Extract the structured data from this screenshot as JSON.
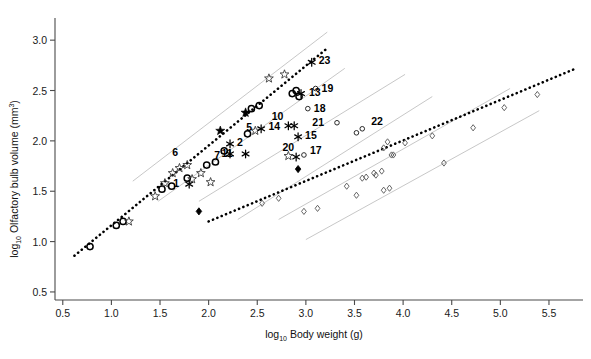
{
  "figure": {
    "background": "#ffffff",
    "axis_color": "#4a4a4a",
    "band_color": "#b9b9b9",
    "marker_color": "#000000"
  },
  "chart_data": {
    "type": "scatter",
    "title": "",
    "subtitle": "",
    "xlabel": "log10 Body weight (g)",
    "ylabel": "log10 Olfactory bulb volume (mm3)",
    "xlabel_main": "Body weight (g)",
    "xlabel_base": "log",
    "xlabel_sub": "10",
    "ylabel_main": "Olfactory bulb volume (mm",
    "ylabel_main_tail": ")",
    "ylabel_sup": "3",
    "ylabel_base": "log",
    "ylabel_sub": "10",
    "xlim": [
      0.42,
      5.85
    ],
    "ylim": [
      0.42,
      3.22
    ],
    "xticks": [
      0.5,
      1.0,
      1.5,
      2.0,
      2.5,
      3.0,
      3.5,
      4.0,
      4.5,
      5.0,
      5.5
    ],
    "yticks": [
      0.5,
      1.0,
      1.5,
      2.0,
      2.5,
      3.0
    ],
    "xticklabels": [
      "0.5",
      "1.0",
      "1.5",
      "2.0",
      "2.5",
      "3.0",
      "3.5",
      "4.0",
      "4.5",
      "5.0",
      "5.5"
    ],
    "yticklabels": [
      "0.5",
      "1.0",
      "1.5",
      "2.0",
      "2.5",
      "3.0"
    ],
    "grid": false,
    "legend": "none",
    "series": [
      {
        "name": "open-circle",
        "marker": "open-circle",
        "points": [
          [
            0.78,
            0.95
          ],
          [
            1.05,
            1.16
          ],
          [
            1.12,
            1.2
          ],
          [
            1.52,
            1.52
          ],
          [
            1.62,
            1.55
          ],
          [
            1.78,
            1.63
          ],
          [
            1.98,
            1.76
          ],
          [
            2.07,
            1.79
          ],
          [
            2.16,
            1.9
          ],
          [
            2.4,
            2.07
          ],
          [
            2.44,
            2.32
          ],
          [
            2.52,
            2.35
          ],
          [
            2.86,
            2.47
          ],
          [
            2.9,
            2.5
          ],
          [
            2.93,
            2.44
          ]
        ]
      },
      {
        "name": "open-star",
        "marker": "open-star",
        "points": [
          [
            1.18,
            1.2
          ],
          [
            1.45,
            1.45
          ],
          [
            1.55,
            1.58
          ],
          [
            1.63,
            1.68
          ],
          [
            1.7,
            1.73
          ],
          [
            1.78,
            1.76
          ],
          [
            1.83,
            1.62
          ],
          [
            1.92,
            1.68
          ],
          [
            2.02,
            1.59
          ],
          [
            2.48,
            2.1
          ],
          [
            2.62,
            2.62
          ],
          [
            2.78,
            2.66
          ],
          [
            2.82,
            1.85
          ]
        ]
      },
      {
        "name": "filled-star",
        "marker": "filled-star",
        "points": [
          [
            2.12,
            2.1
          ],
          [
            2.38,
            2.28
          ]
        ]
      },
      {
        "name": "asterisk-labeled",
        "marker": "asterisk",
        "points": [
          [
            1.8,
            1.57
          ],
          [
            2.22,
            1.97
          ],
          [
            2.22,
            1.87
          ],
          [
            2.38,
            1.87
          ],
          [
            2.54,
            2.12
          ],
          [
            2.82,
            2.15
          ],
          [
            2.88,
            2.15
          ],
          [
            2.95,
            2.47
          ],
          [
            2.92,
            2.04
          ],
          [
            2.9,
            1.84
          ],
          [
            3.06,
            2.78
          ]
        ]
      },
      {
        "name": "filled-diamond",
        "marker": "filled-diamond",
        "points": [
          [
            1.9,
            1.3
          ],
          [
            2.92,
            1.72
          ]
        ]
      },
      {
        "name": "open-diamond",
        "marker": "open-diamond",
        "points": [
          [
            2.55,
            1.38
          ],
          [
            2.72,
            1.43
          ],
          [
            2.98,
            1.3
          ],
          [
            3.12,
            1.33
          ],
          [
            3.42,
            1.55
          ],
          [
            3.58,
            1.63
          ],
          [
            3.62,
            1.64
          ],
          [
            3.7,
            1.68
          ],
          [
            3.72,
            1.66
          ],
          [
            3.78,
            1.7
          ],
          [
            3.8,
            1.93
          ],
          [
            3.84,
            1.99
          ],
          [
            3.88,
            1.86
          ],
          [
            3.9,
            1.86
          ],
          [
            3.8,
            1.51
          ],
          [
            3.86,
            1.53
          ],
          [
            4.3,
            2.05
          ],
          [
            4.42,
            1.78
          ],
          [
            4.72,
            2.13
          ],
          [
            5.04,
            2.33
          ],
          [
            5.38,
            2.46
          ],
          [
            3.52,
            1.46
          ],
          [
            4.02,
            1.98
          ]
        ]
      },
      {
        "name": "open-circle-small",
        "marker": "open-circle-small",
        "points": [
          [
            3.1,
            2.52
          ],
          [
            3.02,
            2.32
          ],
          [
            3.32,
            2.18
          ],
          [
            3.52,
            2.08
          ],
          [
            3.58,
            2.12
          ],
          [
            2.98,
            1.86
          ]
        ]
      }
    ],
    "point_labels": [
      {
        "id": "1",
        "x": 1.8,
        "y": 1.57,
        "tx": -10,
        "ty": 3
      },
      {
        "id": "2",
        "x": 2.22,
        "y": 1.97,
        "tx": 7,
        "ty": 2
      },
      {
        "id": "5",
        "x": 2.54,
        "y": 2.12,
        "tx": -9,
        "ty": 2
      },
      {
        "id": "6",
        "x": 1.8,
        "y": 1.87,
        "tx": -11,
        "ty": 2
      },
      {
        "id": "7",
        "x": 2.22,
        "y": 1.87,
        "tx": -10,
        "ty": 5
      },
      {
        "id": "10",
        "x": 2.82,
        "y": 2.15,
        "tx": -5,
        "ty": -6
      },
      {
        "id": "11",
        "x": 2.38,
        "y": 1.87,
        "tx": -13,
        "ty": 3
      },
      {
        "id": "13",
        "x": 2.95,
        "y": 2.47,
        "tx": 8,
        "ty": 2
      },
      {
        "id": "14",
        "x": 2.88,
        "y": 2.15,
        "tx": -14,
        "ty": 4
      },
      {
        "id": "15",
        "x": 2.92,
        "y": 2.04,
        "tx": 7,
        "ty": 2
      },
      {
        "id": "17",
        "x": 2.98,
        "y": 1.86,
        "tx": 6,
        "ty": -1
      },
      {
        "id": "18",
        "x": 3.02,
        "y": 2.32,
        "tx": 6,
        "ty": 3
      },
      {
        "id": "19",
        "x": 3.1,
        "y": 2.52,
        "tx": 6,
        "ty": 3
      },
      {
        "id": "20",
        "x": 2.9,
        "y": 1.84,
        "tx": -2,
        "ty": -6
      },
      {
        "id": "21",
        "x": 3.32,
        "y": 2.18,
        "tx": -13,
        "ty": 3
      },
      {
        "id": "22",
        "x": 3.62,
        "y": 2.12,
        "tx": 5,
        "ty": -4
      },
      {
        "id": "23",
        "x": 3.06,
        "y": 2.78,
        "tx": 7,
        "ty": 2
      }
    ],
    "regression_lines": [
      {
        "name": "upper-regression",
        "x0": 0.62,
        "y0": 0.86,
        "x1": 3.22,
        "y1": 2.92
      },
      {
        "name": "lower-regression",
        "x0": 2.0,
        "y0": 1.2,
        "x1": 5.78,
        "y1": 2.72
      }
    ],
    "confidence_bands": [
      {
        "name": "upper-band-high",
        "x0": 1.22,
        "y0": 1.6,
        "x1": 3.22,
        "y1": 3.08
      },
      {
        "name": "upper-band-low",
        "x0": 1.48,
        "y0": 1.4,
        "x1": 3.4,
        "y1": 2.72
      },
      {
        "name": "mid-band-high",
        "x0": 1.9,
        "y0": 1.4,
        "x1": 4.02,
        "y1": 2.66
      },
      {
        "name": "mid-band-low",
        "x0": 2.3,
        "y0": 1.22,
        "x1": 4.3,
        "y1": 2.44
      },
      {
        "name": "lower-band-high",
        "x0": 2.72,
        "y0": 1.22,
        "x1": 5.1,
        "y1": 2.52
      },
      {
        "name": "lower-band-low",
        "x0": 3.0,
        "y0": 1.02,
        "x1": 5.4,
        "y1": 2.3
      }
    ]
  }
}
